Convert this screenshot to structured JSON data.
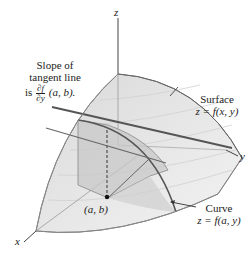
{
  "axes": {
    "x_label": "x",
    "y_label": "y",
    "z_label": "z"
  },
  "annotations": {
    "slope": {
      "line1": "Slope of",
      "line2": "tangent line",
      "prefix": "is",
      "frac_num": "∂f",
      "frac_den": "∂y",
      "suffix": "(a, b)."
    },
    "surface": {
      "title": "Surface",
      "equation": "z = f(x, y)"
    },
    "curve": {
      "title": "Curve",
      "equation": "z = f(a, y)"
    },
    "point": {
      "label": "(a, b)"
    }
  },
  "colors": {
    "surface_fill": "#e6e6e6",
    "surface_shade": "#d2d2d2",
    "plane_fill": "#c4c4c4",
    "floor_fill": "#efefef",
    "line": "#555555",
    "axis": "#444444",
    "point": "#111111"
  }
}
